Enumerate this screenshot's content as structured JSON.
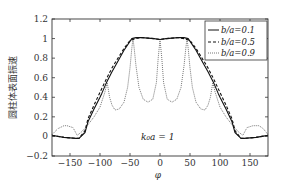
{
  "chart_data": {
    "type": "line",
    "title": "",
    "xlabel": "φ",
    "ylabel": "圆柱体表面振速",
    "xlim": [
      -180,
      180
    ],
    "ylim": [
      -0.2,
      1.2
    ],
    "xticks": [
      -150,
      -100,
      -50,
      0,
      50,
      100,
      150
    ],
    "yticks": [
      -0.2,
      0,
      0.2,
      0.4,
      0.6,
      0.8,
      1,
      1.2
    ],
    "xtick_labels": [
      "−150",
      "−100",
      "−50",
      "0",
      "50",
      "100",
      "150"
    ],
    "ytick_labels": [
      "−0.2",
      "0",
      "0.2",
      "0.4",
      "0.6",
      "0.8",
      "1",
      "1.2"
    ],
    "grid": false,
    "legend_position": "upper right",
    "annotation": "k₀a = 1",
    "series": [
      {
        "name": "b/a=0.1",
        "style": "solid",
        "x": [
          -180,
          -160,
          -140,
          -135,
          -125,
          -120,
          -110,
          -100,
          -97,
          -90,
          -80,
          -69,
          -60,
          -47,
          -40,
          -30,
          -20,
          -10,
          0,
          10,
          20,
          30,
          40,
          47,
          60,
          69,
          80,
          90,
          97,
          100,
          110,
          120,
          125,
          135,
          140,
          160,
          180
        ],
        "y": [
          0.01,
          -0.01,
          -0.02,
          -0.02,
          0.04,
          0.15,
          0.28,
          0.4,
          0.44,
          0.54,
          0.66,
          0.78,
          0.88,
          1.0,
          1.01,
          1.01,
          1.005,
          1.0,
          0.99,
          1.0,
          1.005,
          1.01,
          1.01,
          1.0,
          0.88,
          0.78,
          0.66,
          0.54,
          0.44,
          0.4,
          0.28,
          0.15,
          0.04,
          -0.02,
          -0.02,
          -0.01,
          0.01
        ]
      },
      {
        "name": "b/a=0.5",
        "style": "dashed",
        "x": [
          -180,
          -160,
          -140,
          -135,
          -125,
          -120,
          -110,
          -100,
          -90,
          -80,
          -70,
          -60,
          -50,
          -40,
          -30,
          -20,
          -10,
          0,
          10,
          20,
          30,
          40,
          50,
          60,
          70,
          80,
          90,
          100,
          110,
          120,
          125,
          135,
          140,
          160,
          180
        ],
        "y": [
          0.01,
          -0.01,
          -0.02,
          -0.02,
          0.06,
          0.18,
          0.32,
          0.45,
          0.58,
          0.7,
          0.8,
          0.9,
          0.98,
          1.0,
          1.01,
          1.005,
          1.0,
          0.99,
          1.0,
          1.005,
          1.01,
          1.0,
          0.98,
          0.9,
          0.8,
          0.7,
          0.58,
          0.45,
          0.32,
          0.18,
          0.06,
          -0.02,
          -0.02,
          -0.01,
          0.01
        ]
      },
      {
        "name": "b/a=0.9",
        "style": "dotted",
        "x": [
          -180,
          -170,
          -160,
          -155,
          -145,
          -138,
          -130,
          -120,
          -110,
          -100,
          -92,
          -88,
          -84,
          -80,
          -75,
          -68,
          -60,
          -54,
          -50,
          -47,
          -45,
          -43,
          -40,
          -35,
          -28,
          -20,
          -12,
          -6,
          -3,
          0,
          3,
          6,
          12,
          20,
          28,
          35,
          40,
          43,
          45,
          47,
          50,
          54,
          60,
          68,
          75,
          80,
          84,
          88,
          92,
          100,
          110,
          120,
          130,
          138,
          145,
          155,
          165,
          172,
          180
        ],
        "y": [
          0.02,
          0.08,
          0.11,
          0.11,
          0.09,
          0.01,
          0.05,
          0.12,
          0.2,
          0.3,
          0.45,
          0.55,
          0.4,
          0.32,
          0.27,
          0.28,
          0.35,
          0.5,
          0.7,
          0.9,
          1.0,
          0.9,
          0.72,
          0.5,
          0.38,
          0.35,
          0.38,
          0.55,
          0.8,
          0.99,
          0.8,
          0.55,
          0.38,
          0.35,
          0.38,
          0.5,
          0.72,
          0.9,
          1.0,
          0.9,
          0.7,
          0.5,
          0.35,
          0.28,
          0.27,
          0.32,
          0.4,
          0.55,
          0.45,
          0.3,
          0.2,
          0.12,
          0.05,
          0.01,
          0.09,
          0.11,
          0.11,
          0.08,
          0.02
        ]
      }
    ]
  },
  "legend": {
    "items": [
      {
        "label": "b/a=0.1",
        "style": "solid"
      },
      {
        "label": "b/a=0.5",
        "style": "dashed"
      },
      {
        "label": "b/a=0.9",
        "style": "dotted"
      }
    ]
  },
  "colors": {
    "axis": "#333333",
    "solid": "#111111",
    "dashed": "#111111",
    "dotted": "#777777"
  }
}
